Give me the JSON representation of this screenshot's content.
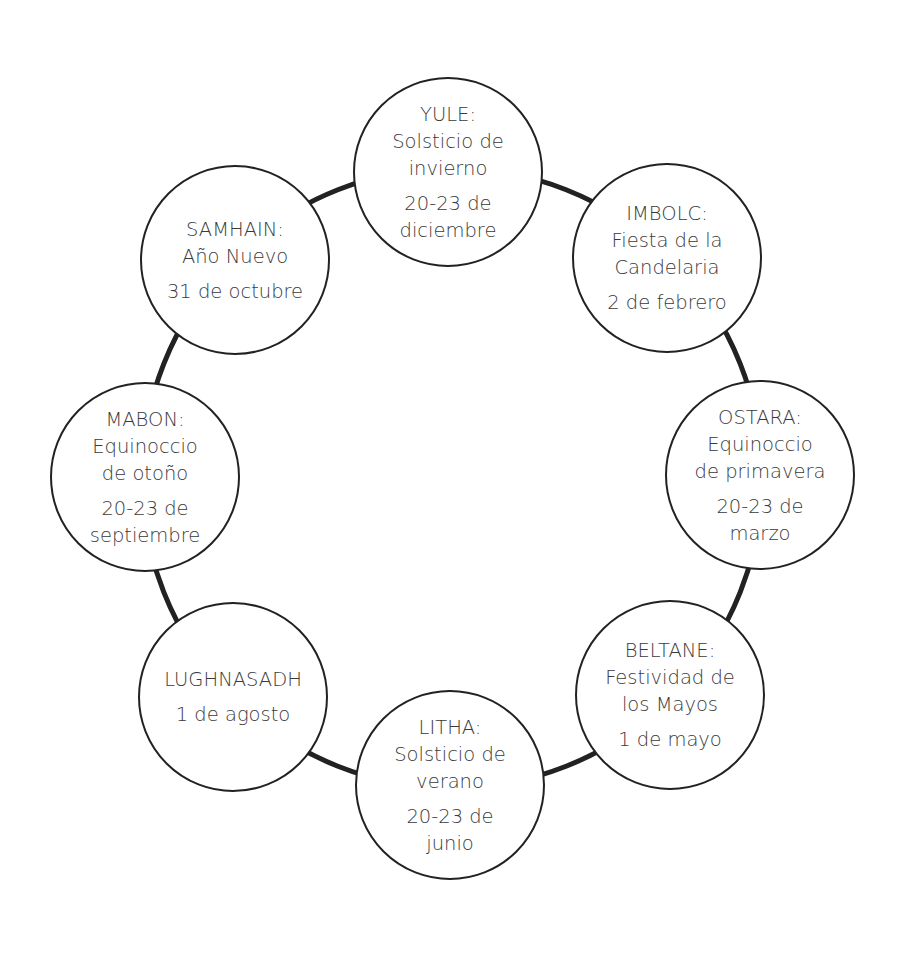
{
  "diagram": {
    "type": "wheel-of-the-year",
    "ring_color": "#222222",
    "text_color": "#3a3a3a",
    "festivals": [
      {
        "id": "yule",
        "title": "YULE:",
        "subtitle": [
          "Solsticio de",
          "invierno"
        ],
        "date": [
          "20-23 de",
          "diciembre"
        ]
      },
      {
        "id": "imbolc",
        "title": "IMBOLC:",
        "subtitle": [
          "Fiesta de la",
          "Candelaria"
        ],
        "date": [
          "2 de febrero"
        ]
      },
      {
        "id": "ostara",
        "title": "OSTARA:",
        "subtitle": [
          "Equinoccio",
          "de primavera"
        ],
        "date": [
          "20-23 de",
          "marzo"
        ]
      },
      {
        "id": "beltane",
        "title": "BELTANE:",
        "subtitle": [
          "Festividad de",
          "los Mayos"
        ],
        "date": [
          "1 de mayo"
        ]
      },
      {
        "id": "litha",
        "title": "LITHA:",
        "subtitle": [
          "Solsticio de",
          "verano"
        ],
        "date": [
          "20-23 de",
          "junio"
        ]
      },
      {
        "id": "lughnasadh",
        "title": "LUGHNASADH",
        "subtitle": [],
        "date": [
          "1 de agosto"
        ]
      },
      {
        "id": "mabon",
        "title": "MABON:",
        "subtitle": [
          "Equinoccio",
          "de otoño"
        ],
        "date": [
          "20-23 de",
          "septiembre"
        ]
      },
      {
        "id": "samhain",
        "title": "SAMHAIN:",
        "subtitle": [
          "Año Nuevo"
        ],
        "date": [
          "31 de octubre"
        ]
      }
    ]
  }
}
